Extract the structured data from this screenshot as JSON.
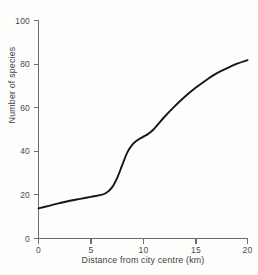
{
  "chart_data": {
    "type": "line",
    "title": "",
    "subtitle": "",
    "xlabel": "Distance from city centre (km)",
    "ylabel": "Number of species",
    "xlim": [
      0,
      20
    ],
    "ylim": [
      0,
      100
    ],
    "xticks": [
      0,
      5,
      10,
      15,
      20
    ],
    "yticks": [
      0,
      20,
      40,
      60,
      80,
      100
    ],
    "xtick_labels": [
      "0",
      "5",
      "10",
      "15",
      "20"
    ],
    "ytick_labels": [
      "0",
      "20",
      "40",
      "60",
      "80",
      "100"
    ],
    "grid": false,
    "legend": null,
    "legend_position": "none",
    "annotations": [],
    "series": [
      {
        "name": "Number of species",
        "color": "#151515",
        "x": [
          0,
          1,
          2,
          3,
          4,
          5,
          6,
          6.5,
          7,
          7.5,
          8,
          8.5,
          9,
          9.5,
          10,
          10.5,
          11,
          12,
          13,
          14,
          15,
          16,
          17,
          18,
          19,
          20
        ],
        "y": [
          13.8,
          15.0,
          16.2,
          17.3,
          18.2,
          19.1,
          20.0,
          21.0,
          23.2,
          27.5,
          33.5,
          39.5,
          43.2,
          45.2,
          46.6,
          48.0,
          50.0,
          55.5,
          60.5,
          65.0,
          69.0,
          72.5,
          75.6,
          78.0,
          80.2,
          81.8
        ]
      }
    ]
  },
  "axis": {
    "x_tick_values": [
      "0",
      "5",
      "10",
      "15",
      "20"
    ],
    "y_tick_values": [
      "0",
      "20",
      "40",
      "60",
      "80",
      "100"
    ],
    "x_title": "Distance from city centre (km)",
    "y_title": "Number of species"
  },
  "colors": {
    "curve": "#151515",
    "axis": "#6e6e6e",
    "text": "#414141",
    "background": "#fdfdfc"
  }
}
